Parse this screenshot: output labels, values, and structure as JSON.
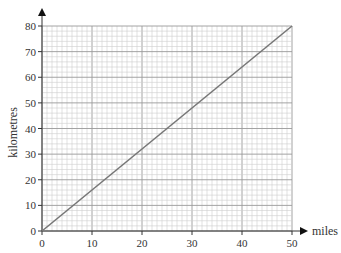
{
  "chart_data": {
    "type": "line",
    "title": "",
    "xlabel": "miles",
    "ylabel": "kilometres",
    "xlim": [
      0,
      50
    ],
    "ylim": [
      0,
      80
    ],
    "x_ticks": [
      0,
      10,
      20,
      30,
      40,
      50
    ],
    "y_ticks": [
      0,
      10,
      20,
      30,
      40,
      50,
      60,
      70,
      80
    ],
    "grid": true,
    "grid_minor_x_step": 1,
    "grid_minor_y_step": 2,
    "series": [
      {
        "name": "conversion",
        "x": [
          0,
          50
        ],
        "y": [
          0,
          80
        ]
      }
    ],
    "colors": {
      "line": "#777777",
      "grid_minor": "#cfcfcf",
      "grid_major": "#9a9a9a",
      "axis": "#333333"
    }
  }
}
